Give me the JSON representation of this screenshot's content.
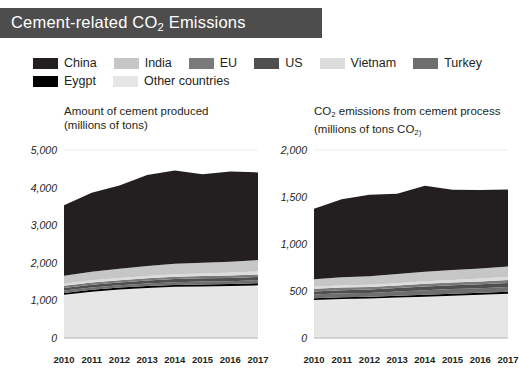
{
  "header": {
    "title_prefix": "Cement-related CO",
    "title_sub": "2",
    "title_suffix": " Emissions",
    "bar_color": "#4d4d4d"
  },
  "legend": {
    "rows": [
      [
        {
          "label": "China",
          "color": "#231f20"
        },
        {
          "label": "India",
          "color": "#c6c6c6"
        },
        {
          "label": "EU",
          "color": "#7a7a7a"
        },
        {
          "label": "US",
          "color": "#4f4f4f"
        },
        {
          "label": "Vietnam",
          "color": "#dcdcdc"
        },
        {
          "label": "Turkey",
          "color": "#6e6e6e"
        }
      ],
      [
        {
          "label": "Eygpt",
          "color": "#000000"
        },
        {
          "label": "Other countries",
          "color": "#e6e6e6"
        }
      ]
    ]
  },
  "chart_data": [
    {
      "type": "area",
      "id": "cement-produced",
      "title": "Amount of cement produced",
      "subtitle": "(millions of tons)",
      "xlabel": "",
      "ylabel": "millions of tons",
      "categories": [
        2010,
        2011,
        2012,
        2013,
        2014,
        2015,
        2016,
        2017
      ],
      "ylim": [
        0,
        5000
      ],
      "yticks": [
        0,
        1000,
        2000,
        3000,
        4000,
        5000
      ],
      "ytick_labels": [
        "0",
        "1,000",
        "2,000",
        "3,000",
        "4,000",
        "5,000"
      ],
      "grid": false,
      "legend_position": "top",
      "stack_order": [
        "Other countries",
        "Eygpt",
        "Turkey",
        "US",
        "EU",
        "Vietnam",
        "India",
        "China"
      ],
      "series": [
        {
          "name": "Other countries",
          "color": "#e6e6e6",
          "values": [
            1150,
            1230,
            1290,
            1330,
            1360,
            1370,
            1380,
            1400
          ]
        },
        {
          "name": "Eygpt",
          "color": "#000000",
          "values": [
            48,
            50,
            50,
            50,
            50,
            55,
            55,
            58
          ]
        },
        {
          "name": "Turkey",
          "color": "#6e6e6e",
          "values": [
            63,
            65,
            64,
            71,
            75,
            77,
            77,
            80
          ]
        },
        {
          "name": "US",
          "color": "#4f4f4f",
          "values": [
            66,
            68,
            74,
            77,
            83,
            84,
            86,
            87
          ]
        },
        {
          "name": "EU",
          "color": "#7a7a7a",
          "values": [
            60,
            62,
            60,
            60,
            62,
            62,
            63,
            64
          ]
        },
        {
          "name": "Vietnam",
          "color": "#dcdcdc",
          "values": [
            56,
            60,
            57,
            60,
            65,
            70,
            78,
            85
          ]
        },
        {
          "name": "India",
          "color": "#c6c6c6",
          "values": [
            210,
            230,
            250,
            265,
            280,
            285,
            290,
            300
          ]
        },
        {
          "name": "China",
          "color": "#231f20",
          "values": [
            1880,
            2100,
            2210,
            2420,
            2480,
            2350,
            2400,
            2330
          ]
        }
      ],
      "totals": [
        3533,
        3865,
        4055,
        4333,
        4455,
        4353,
        4429,
        4404
      ]
    },
    {
      "type": "area",
      "id": "co2-emissions",
      "title_prefix": "CO",
      "title_sub": "2",
      "title_suffix": " emissions from cement process",
      "subtitle_prefix": "(millions of tons CO",
      "subtitle_sub": "2)",
      "xlabel": "",
      "ylabel": "millions of tons CO2",
      "categories": [
        2010,
        2011,
        2012,
        2013,
        2014,
        2015,
        2016,
        2017
      ],
      "ylim": [
        0,
        2000
      ],
      "yticks": [
        0,
        500,
        1000,
        1500,
        2000
      ],
      "ytick_labels": [
        "0",
        "500",
        "1,000",
        "1,500",
        "2,000"
      ],
      "grid": false,
      "legend_position": "top",
      "stack_order": [
        "Other countries",
        "Eygpt",
        "Turkey",
        "US",
        "EU",
        "Vietnam",
        "India",
        "China"
      ],
      "series": [
        {
          "name": "Other countries",
          "color": "#e6e6e6",
          "values": [
            405,
            415,
            420,
            430,
            440,
            450,
            460,
            470
          ]
        },
        {
          "name": "Eygpt",
          "color": "#000000",
          "values": [
            18,
            19,
            19,
            19,
            20,
            21,
            21,
            22
          ]
        },
        {
          "name": "Turkey",
          "color": "#6e6e6e",
          "values": [
            40,
            41,
            41,
            45,
            48,
            49,
            49,
            51
          ]
        },
        {
          "name": "US",
          "color": "#4f4f4f",
          "values": [
            32,
            33,
            35,
            37,
            40,
            41,
            42,
            43
          ]
        },
        {
          "name": "EU",
          "color": "#7a7a7a",
          "values": [
            28,
            29,
            28,
            28,
            29,
            29,
            30,
            30
          ]
        },
        {
          "name": "Vietnam",
          "color": "#dcdcdc",
          "values": [
            22,
            24,
            23,
            24,
            26,
            28,
            31,
            34
          ]
        },
        {
          "name": "India",
          "color": "#c6c6c6",
          "values": [
            80,
            86,
            92,
            97,
            103,
            105,
            107,
            110
          ]
        },
        {
          "name": "China",
          "color": "#231f20",
          "values": [
            750,
            830,
            865,
            855,
            915,
            855,
            835,
            820
          ]
        }
      ],
      "totals": [
        1375,
        1477,
        1523,
        1535,
        1621,
        1578,
        1575,
        1580
      ]
    }
  ]
}
